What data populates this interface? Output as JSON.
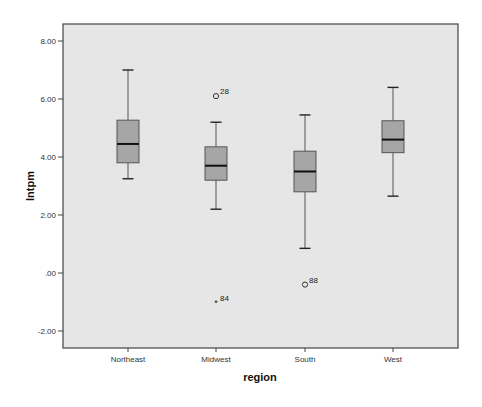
{
  "chart_data": {
    "type": "boxplot",
    "title": "",
    "xlabel": "region",
    "ylabel": "lntpm",
    "ylim": [
      -2.5,
      8.5
    ],
    "yticks": [
      8.0,
      6.0,
      4.0,
      2.0,
      0.0,
      -2.0
    ],
    "ytick_labels": [
      "8.00",
      "6.00",
      "4.00",
      "2.00",
      ".00",
      "-2.00"
    ],
    "grid": false,
    "legend": null,
    "categories": [
      "Northeast",
      "Midwest",
      "South",
      "West"
    ],
    "boxes": [
      {
        "category": "Northeast",
        "whisker_low": 3.25,
        "q1": 3.8,
        "median": 4.45,
        "q3": 5.27,
        "whisker_high": 7.0,
        "outliers": []
      },
      {
        "category": "Midwest",
        "whisker_low": 2.2,
        "q1": 3.2,
        "median": 3.7,
        "q3": 4.35,
        "whisker_high": 5.2,
        "outliers": [
          {
            "value": 6.1,
            "label": "28",
            "marker": "circle"
          },
          {
            "value": -1.05,
            "label": "84",
            "marker": "star"
          }
        ]
      },
      {
        "category": "South",
        "whisker_low": 0.85,
        "q1": 2.8,
        "median": 3.5,
        "q3": 4.2,
        "whisker_high": 5.45,
        "outliers": [
          {
            "value": -0.4,
            "label": "88",
            "marker": "circle"
          }
        ]
      },
      {
        "category": "West",
        "whisker_low": 2.65,
        "q1": 4.15,
        "median": 4.6,
        "q3": 5.25,
        "whisker_high": 6.4,
        "outliers": []
      }
    ]
  },
  "colors": {
    "plot_background": "#e6e6e6",
    "box_fill": "#a6a6a6",
    "box_stroke": "#555555",
    "frame": "#444444",
    "median": "#111111"
  },
  "axis": {
    "x_title": "region",
    "y_title": "lntpm"
  }
}
